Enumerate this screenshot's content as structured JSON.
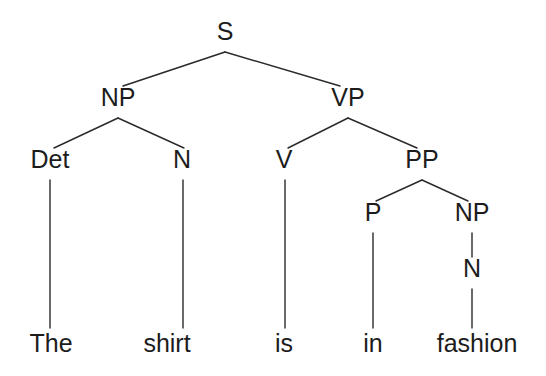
{
  "figure": {
    "kind": "syntax-tree",
    "sentence": "The shirt is in fashion",
    "background_color": "#ffffff",
    "text_color": "#1c1c1c",
    "edge_color": "#2a2a2a"
  },
  "nodes": {
    "s": {
      "label": "S",
      "x": 225,
      "y": 40
    },
    "np1": {
      "label": "NP",
      "x": 118,
      "y": 106
    },
    "vp": {
      "label": "VP",
      "x": 348,
      "y": 106
    },
    "det": {
      "label": "Det",
      "x": 50,
      "y": 168
    },
    "n1": {
      "label": "N",
      "x": 182,
      "y": 168
    },
    "v": {
      "label": "V",
      "x": 284,
      "y": 168
    },
    "pp": {
      "label": "PP",
      "x": 422,
      "y": 168
    },
    "p": {
      "label": "P",
      "x": 373,
      "y": 221
    },
    "np2": {
      "label": "NP",
      "x": 472,
      "y": 221
    },
    "n2": {
      "label": "N",
      "x": 472,
      "y": 277
    }
  },
  "leaves": {
    "the": {
      "label": "The",
      "x": 51,
      "y": 352
    },
    "shirt": {
      "label": "shirt",
      "x": 167,
      "y": 352
    },
    "is": {
      "label": "is",
      "x": 284,
      "y": 352
    },
    "in": {
      "label": "in",
      "x": 373,
      "y": 352
    },
    "fashion": {
      "label": "fashion",
      "x": 477,
      "y": 352
    }
  },
  "edges": [
    {
      "name": "edge-s-np",
      "from": "S",
      "to": "NP",
      "x1": 225,
      "y1": 52,
      "x2": 123,
      "y2": 86
    },
    {
      "name": "edge-s-vp",
      "from": "S",
      "to": "VP",
      "x1": 225,
      "y1": 52,
      "x2": 340,
      "y2": 86
    },
    {
      "name": "edge-np-det",
      "from": "NP",
      "to": "Det",
      "x1": 118,
      "y1": 118,
      "x2": 54,
      "y2": 148
    },
    {
      "name": "edge-np-n",
      "from": "NP",
      "to": "N",
      "x1": 118,
      "y1": 118,
      "x2": 184,
      "y2": 148
    },
    {
      "name": "edge-vp-v",
      "from": "VP",
      "to": "V",
      "x1": 348,
      "y1": 118,
      "x2": 288,
      "y2": 148
    },
    {
      "name": "edge-vp-pp",
      "from": "VP",
      "to": "PP",
      "x1": 348,
      "y1": 118,
      "x2": 417,
      "y2": 148
    },
    {
      "name": "edge-pp-p",
      "from": "PP",
      "to": "P",
      "x1": 422,
      "y1": 180,
      "x2": 376,
      "y2": 201
    },
    {
      "name": "edge-pp-np",
      "from": "PP",
      "to": "NP",
      "x1": 422,
      "y1": 180,
      "x2": 468,
      "y2": 201
    },
    {
      "name": "edge-np2-n2",
      "from": "NP",
      "to": "N",
      "x1": 472,
      "y1": 233,
      "x2": 472,
      "y2": 257
    },
    {
      "name": "edge-det-the",
      "from": "Det",
      "to": "The",
      "x1": 50,
      "y1": 180,
      "x2": 50,
      "y2": 328
    },
    {
      "name": "edge-n1-shirt",
      "from": "N",
      "to": "shirt",
      "x1": 183,
      "y1": 180,
      "x2": 183,
      "y2": 328
    },
    {
      "name": "edge-v-is",
      "from": "V",
      "to": "is",
      "x1": 285,
      "y1": 180,
      "x2": 285,
      "y2": 328
    },
    {
      "name": "edge-p-in",
      "from": "P",
      "to": "in",
      "x1": 373,
      "y1": 233,
      "x2": 373,
      "y2": 328
    },
    {
      "name": "edge-n2-fashion",
      "from": "N",
      "to": "fashion",
      "x1": 472,
      "y1": 289,
      "x2": 472,
      "y2": 328
    }
  ]
}
